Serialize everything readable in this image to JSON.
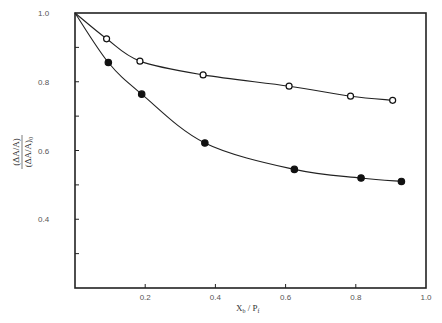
{
  "chart_data": {
    "type": "scatter",
    "title": "",
    "xlabel": "X_b / P_f",
    "ylabel": "(ΔA/A) / (ΔA/A)_0",
    "xlim": [
      0.0,
      1.0
    ],
    "ylim": [
      0.2,
      1.0
    ],
    "x_ticks": [
      0.2,
      0.4,
      0.6,
      0.8,
      1.0
    ],
    "x_tick_labels": [
      "0.2",
      "0.4",
      "0.6",
      "0.8",
      "1.0"
    ],
    "y_ticks": [
      0.4,
      0.6,
      0.8,
      1.0
    ],
    "y_tick_labels": [
      "0.4",
      "0.6",
      "0.8",
      "1.0"
    ],
    "y_minor_ticks": [
      0.3,
      0.5,
      0.7,
      0.9
    ],
    "grid": false,
    "legend": null,
    "series": [
      {
        "name": "open circles",
        "marker": "open-circle",
        "fit_curve": true,
        "curve_start": [
          0.0,
          1.0
        ],
        "x": [
          0.09,
          0.185,
          0.365,
          0.61,
          0.785,
          0.905
        ],
        "y": [
          0.925,
          0.86,
          0.82,
          0.787,
          0.758,
          0.746
        ]
      },
      {
        "name": "filled circles",
        "marker": "filled-circle",
        "fit_curve": true,
        "curve_start": [
          0.0,
          1.0
        ],
        "x": [
          0.095,
          0.19,
          0.37,
          0.625,
          0.815,
          0.93
        ],
        "y": [
          0.856,
          0.764,
          0.622,
          0.545,
          0.52,
          0.51
        ]
      }
    ]
  }
}
